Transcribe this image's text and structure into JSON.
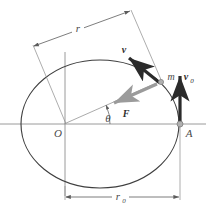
{
  "figure": {
    "type": "physics-orbit-diagram",
    "background_color": "#ffffff"
  },
  "colors": {
    "orbit_curve": "#3f3f3f",
    "axis_line": "#8a8a8a",
    "dimension_line": "#6e6e6e",
    "radius_line": "#9a9a9a",
    "velocity_arrow": "#2b2b2b",
    "force_arrow": "#9b9b9b",
    "point_marker": "#8e8e8e",
    "label_text": "#4a4a4a"
  },
  "labels": {
    "radius_r": "r",
    "radius_r0_base": "r",
    "radius_r0_sub": "0",
    "origin": "O",
    "apse_point": "A",
    "mass": "m",
    "velocity": "v",
    "initial_velocity_base": "v",
    "initial_velocity_sub": "0",
    "force": "F",
    "angle": "θ"
  },
  "geometry": {
    "ellipse": {
      "cx": 100,
      "cy": 124,
      "rx": 79,
      "ry": 64
    },
    "origin_point": {
      "x": 65,
      "y": 124
    },
    "apse_point": {
      "x": 180,
      "y": 124
    },
    "mass_point": {
      "x": 160,
      "y": 82
    },
    "horizontal_axis": {
      "x1": 0,
      "y1": 124,
      "x2": 206,
      "y2": 124
    },
    "vertical_axis": {
      "x": 65,
      "y1": 52,
      "y2": 196
    },
    "r_dimension": {
      "x1": 33,
      "y1": 47,
      "x2": 130,
      "y2": 11
    },
    "r0_dimension": {
      "x1": 65,
      "y1": 197,
      "x2": 180,
      "y2": 197
    },
    "angle_value_deg": 20
  },
  "elements": [
    {
      "name": "orbit-ellipse",
      "kind": "curve"
    },
    {
      "name": "horizontal-axis",
      "kind": "line"
    },
    {
      "name": "vertical-axis",
      "kind": "line"
    },
    {
      "name": "radius-line",
      "kind": "line"
    },
    {
      "name": "force-vector",
      "kind": "arrow"
    },
    {
      "name": "velocity-vector",
      "kind": "arrow"
    },
    {
      "name": "initial-velocity-vector",
      "kind": "arrow"
    },
    {
      "name": "r-dimension",
      "kind": "dimension"
    },
    {
      "name": "r0-dimension",
      "kind": "dimension"
    },
    {
      "name": "angle-arc",
      "kind": "arc"
    }
  ]
}
